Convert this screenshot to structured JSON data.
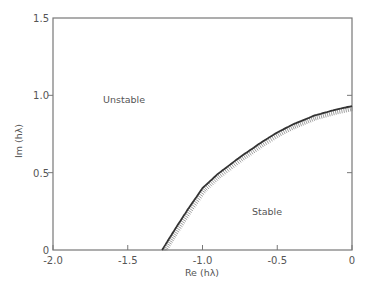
{
  "chart_data": {
    "type": "line",
    "title": "",
    "xlabel": "Re (hλ)",
    "ylabel": "Im (hλ)",
    "xlim": [
      -2.0,
      0
    ],
    "ylim": [
      0,
      1.5
    ],
    "grid": false,
    "legend": null,
    "x_ticks": [
      "-2.0",
      "-1.5",
      "-1.0",
      "-0.5",
      "0"
    ],
    "x_tick_values": [
      -2.0,
      -1.5,
      -1.0,
      -0.5,
      0
    ],
    "y_ticks": [
      "0",
      "0.5",
      "1.0",
      "1.5"
    ],
    "y_tick_values": [
      0,
      0.5,
      1.0,
      1.5
    ],
    "series": [
      {
        "name": "stability boundary",
        "hatched_side": "stable (below/right)",
        "x": [
          -1.27,
          -1.2,
          -1.1,
          -1.0,
          -0.9,
          -0.75,
          -0.6,
          -0.5,
          -0.4,
          -0.25,
          -0.1,
          0
        ],
        "y": [
          0,
          0.11,
          0.26,
          0.4,
          0.49,
          0.6,
          0.7,
          0.76,
          0.81,
          0.87,
          0.91,
          0.93
        ]
      }
    ],
    "annotations": [
      {
        "text": "Unstable",
        "x": -1.65,
        "y": 0.97
      },
      {
        "text": "Stable",
        "x": -0.35,
        "y": 0.24
      }
    ]
  },
  "labels": {
    "xlabel": "Re (hλ)",
    "ylabel": "Im (hλ)",
    "unstable": "Unstable",
    "stable": "Stable",
    "x_ticks": [
      "-2.0",
      "-1.5",
      "-1.0",
      "-0.5",
      "0"
    ],
    "y_ticks": [
      "0",
      "0.5",
      "1.0",
      "1.5"
    ]
  }
}
